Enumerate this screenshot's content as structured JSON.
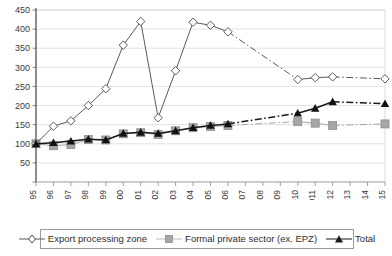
{
  "chart_data": {
    "type": "line",
    "title": "",
    "xlabel": "",
    "ylabel": "",
    "grid": true,
    "legend_position": "bottom",
    "ylim": [
      0,
      450
    ],
    "yticks": [
      0,
      50,
      100,
      150,
      200,
      250,
      300,
      350,
      400,
      450
    ],
    "ytick_labels": [
      "",
      "50",
      "100",
      "150",
      "200",
      "250",
      "300",
      "350",
      "400",
      "450"
    ],
    "categories": [
      "1995",
      "1996",
      "1997",
      "1998",
      "1999",
      "2000",
      "2001",
      "2002",
      "2003",
      "2004",
      "2005",
      "2006",
      "2007",
      "2008",
      "2009",
      "2010",
      "2011",
      "2012",
      "2013",
      "2014",
      "2015"
    ],
    "series": [
      {
        "name": "Export processing zone",
        "marker": "diamond-open",
        "color": "#5a5a5a",
        "values": [
          100,
          146,
          160,
          200,
          244,
          358,
          420,
          168,
          291,
          418,
          410,
          393,
          null,
          null,
          null,
          268,
          273,
          275,
          null,
          null,
          270
        ]
      },
      {
        "name": "Formal private sector (ex. EPZ)",
        "marker": "square-filled",
        "color": "#a6a6a6",
        "values": [
          100,
          95,
          98,
          111,
          110,
          126,
          129,
          124,
          134,
          142,
          145,
          148,
          null,
          null,
          null,
          158,
          154,
          148,
          null,
          null,
          152
        ]
      },
      {
        "name": "Total",
        "marker": "triangle-filled",
        "color": "#1a1a1a",
        "values": [
          100,
          103,
          107,
          112,
          110,
          127,
          130,
          127,
          134,
          142,
          148,
          152,
          null,
          null,
          null,
          180,
          193,
          210,
          null,
          null,
          205
        ]
      }
    ]
  },
  "legend": {
    "items": [
      {
        "label": "Export processing zone"
      },
      {
        "label": "Formal private sector (ex. EPZ)"
      },
      {
        "label": "Total"
      }
    ]
  }
}
